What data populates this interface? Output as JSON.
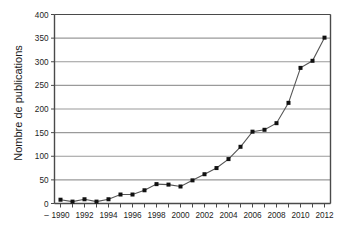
{
  "chart_data": {
    "type": "line",
    "title": "",
    "xlabel": "",
    "ylabel": "Nombre de publications",
    "ylim": [
      0,
      400
    ],
    "ytick_step": 50,
    "yticks": [
      "0",
      "50",
      "100",
      "150",
      "200",
      "250",
      "300",
      "350",
      "400"
    ],
    "xlim": [
      1989.5,
      2012.5
    ],
    "x": [
      1990,
      1991,
      1992,
      1993,
      1994,
      1995,
      1996,
      1997,
      1998,
      1999,
      2000,
      2001,
      2002,
      2003,
      2004,
      2005,
      2006,
      2007,
      2008,
      2009,
      2010,
      2011,
      2012
    ],
    "xtick_labels": [
      "1990",
      "1992",
      "1994",
      "1996",
      "1998",
      "2000",
      "2002",
      "2004",
      "2006",
      "2008",
      "2010",
      "2012"
    ],
    "xtick_leading_dash": "–",
    "values": [
      8,
      4,
      9,
      4,
      9,
      19,
      19,
      28,
      41,
      40,
      36,
      49,
      62,
      75,
      94,
      120,
      152,
      156,
      170,
      213,
      287,
      302,
      351
    ],
    "series": [
      {
        "name": "Nombre de publications",
        "values": [
          8,
          4,
          9,
          4,
          9,
          19,
          19,
          28,
          41,
          40,
          36,
          49,
          62,
          75,
          94,
          120,
          152,
          156,
          170,
          213,
          287,
          302,
          351
        ]
      }
    ],
    "grid": true,
    "grid_axis": "y",
    "legend": false,
    "legend_position": "none",
    "marker": "square",
    "line_color": "#555555",
    "marker_color": "#111111",
    "grid_color": "#9a9a9a",
    "axis_color": "#4a4a4a",
    "background_color": "#ffffff",
    "plot_background_color": "#ffffff"
  }
}
